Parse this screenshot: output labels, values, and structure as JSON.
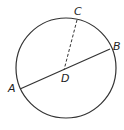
{
  "diagram": {
    "type": "circle-chord",
    "labels": {
      "A": "A",
      "B": "B",
      "C": "C",
      "D": "D"
    },
    "circle": {
      "cx": 66,
      "cy": 68,
      "r": 50
    },
    "points": {
      "A": {
        "x": 20,
        "y": 89
      },
      "B": {
        "x": 110,
        "y": 49
      },
      "C": {
        "x": 77,
        "y": 20
      },
      "D": {
        "x": 64,
        "y": 70
      }
    },
    "segments": [
      {
        "from": "A",
        "to": "B",
        "style": "solid"
      },
      {
        "from": "C",
        "to": "D",
        "style": "dashed"
      }
    ],
    "stroke_color": "#333333"
  }
}
